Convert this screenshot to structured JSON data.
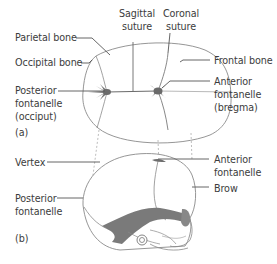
{
  "figure": {
    "panel_a": {
      "tag": "(a)",
      "labels": {
        "parietal_bone": "Parietal bone",
        "occipital_bone": "Occipital bone",
        "posterior_fontanelle": [
          "Posterior",
          "fontanelle",
          "(occiput)"
        ],
        "sagittal_suture": [
          "Sagittal",
          "suture"
        ],
        "coronal_suture": [
          "Coronal",
          "suture"
        ],
        "frontal_bone": "Frontal bone",
        "anterior_fontanelle": [
          "Anterior",
          "fontanelle",
          "(bregma)"
        ]
      }
    },
    "panel_b": {
      "tag": "(b)",
      "labels": {
        "vertex": "Vertex",
        "posterior_fontanelle": [
          "Posterior",
          "fontanelle"
        ],
        "anterior_fontanelle": [
          "Anterior",
          "fontanelle"
        ],
        "brow": "Brow"
      }
    },
    "colors": {
      "line": "#555555",
      "outline": "#8a8a8a",
      "fontanelle_fill": "#6e6e6e",
      "dashed": "#9a9a9a",
      "text": "#3c3c3c"
    }
  }
}
